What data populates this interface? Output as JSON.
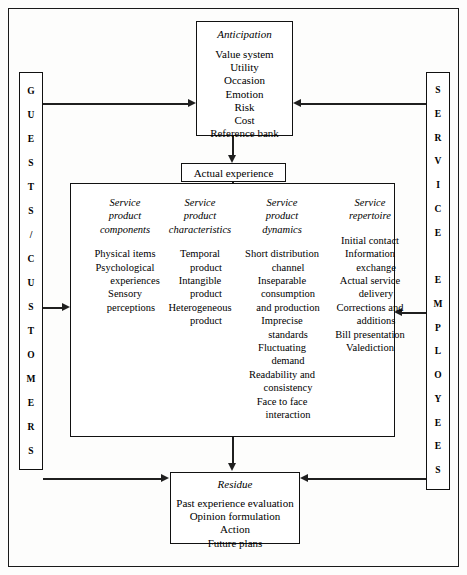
{
  "diagram": {
    "frame": {
      "name": "outer-frame"
    },
    "anticipation": {
      "title": "Anticipation",
      "items": [
        "Value system",
        "Utility",
        "Occasion",
        "Emotion",
        "Risk",
        "Cost",
        "Reference bank"
      ]
    },
    "actual_experience": {
      "label": "Actual experience"
    },
    "service_box": {
      "columns": [
        {
          "heading": [
            "Service",
            "product",
            "components"
          ],
          "items": [
            {
              "text": "Physical items",
              "indent": 0
            },
            {
              "text": "Psychological",
              "indent": 0
            },
            {
              "text": "experiences",
              "indent": 2
            },
            {
              "text": "Sensory",
              "indent": 0
            },
            {
              "text": "perceptions",
              "indent": 1
            }
          ]
        },
        {
          "heading": [
            "Service",
            "product",
            "characteristics"
          ],
          "items": [
            {
              "text": "Temporal",
              "indent": 0
            },
            {
              "text": "product",
              "indent": 1
            },
            {
              "text": "Intangible",
              "indent": 0
            },
            {
              "text": "product",
              "indent": 1
            },
            {
              "text": "Heterogeneous",
              "indent": 0
            },
            {
              "text": "product",
              "indent": 1
            }
          ]
        },
        {
          "heading": [
            "Service",
            "product",
            "dynamics"
          ],
          "items": [
            {
              "text": "Short distribution",
              "indent": 0
            },
            {
              "text": "channel",
              "indent": 1
            },
            {
              "text": "Inseparable",
              "indent": 0
            },
            {
              "text": "consumption",
              "indent": 1
            },
            {
              "text": "and production",
              "indent": 1
            },
            {
              "text": "Imprecise",
              "indent": 0
            },
            {
              "text": "standards",
              "indent": 1
            },
            {
              "text": "Fluctuating",
              "indent": 0
            },
            {
              "text": "demand",
              "indent": 1
            },
            {
              "text": "Readability and",
              "indent": 0
            },
            {
              "text": "consistency",
              "indent": 1
            },
            {
              "text": "Face to face",
              "indent": 0
            },
            {
              "text": "interaction",
              "indent": 1
            }
          ]
        },
        {
          "heading": [
            "Service",
            "repertoire"
          ],
          "items": [
            {
              "text": "Initial contact",
              "indent": 0
            },
            {
              "text": "Information",
              "indent": 0
            },
            {
              "text": "exchange",
              "indent": 1
            },
            {
              "text": "Actual service",
              "indent": 0
            },
            {
              "text": "delivery",
              "indent": 1
            },
            {
              "text": "Corrections and",
              "indent": 0
            },
            {
              "text": "additions",
              "indent": 1
            },
            {
              "text": "Bill presentation",
              "indent": 0
            },
            {
              "text": "Valediction",
              "indent": 0
            }
          ]
        }
      ]
    },
    "residue": {
      "title": "Residue",
      "items": [
        "Past experience evaluation",
        "Opinion formulation",
        "Action",
        "Future plans"
      ]
    },
    "left_bar": {
      "label": "GUESTS/CUSTOMERS",
      "letters": [
        "G",
        "U",
        "E",
        "S",
        "T",
        "S",
        "/",
        "C",
        "U",
        "S",
        "T",
        "O",
        "M",
        "E",
        "R",
        "S"
      ]
    },
    "right_bar": {
      "label": "SERVICE EMPLOYEES",
      "letters": [
        "S",
        "E",
        "R",
        "V",
        "I",
        "C",
        "E",
        " ",
        "E",
        "M",
        "P",
        "L",
        "O",
        "Y",
        "E",
        "E",
        "S"
      ]
    },
    "colors": {
      "stroke": "#111111",
      "arrow": "#1f1f1f",
      "background": "#ffffff"
    }
  }
}
